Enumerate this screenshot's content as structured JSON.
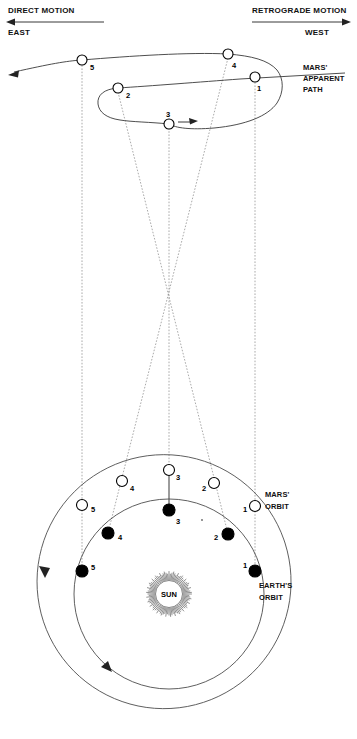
{
  "figure": {
    "header_left": {
      "motion_label": "DIRECT MOTION",
      "direction_label": "EAST",
      "arrow": "left-arrow-icon"
    },
    "header_right": {
      "motion_label": "RETROGRADE MOTION",
      "direction_label": "WEST",
      "arrow": "right-arrow-icon"
    },
    "annotations": {
      "mars_apparent_path": "MARS'\nAPPARENT\nPATH",
      "mars_apparent_path_line1": "MARS'",
      "mars_apparent_path_line2": "APPARENT",
      "mars_apparent_path_line3": "PATH",
      "mars_orbit_line1": "MARS'",
      "mars_orbit_line2": "ORBIT",
      "earth_orbit_line1": "EARTH'S",
      "earth_orbit_line2": "ORBIT",
      "sun_label": "SUN"
    },
    "colors": {
      "background": "#ffffff",
      "ink": "#111111",
      "orbit_stroke": "#4d4d4d",
      "sight_line": "#8d8d8d",
      "marker_fill_earth": "#000000",
      "marker_fill_mars": "#ffffff"
    }
  },
  "chart_data": {
    "type": "diagram-scatter",
    "xlabel": "",
    "ylabel": "",
    "grid": false,
    "legend": false,
    "series": [
      {
        "name": "Mars apparent path (sky)",
        "marker": "open-circle",
        "points": [
          {
            "label": "1",
            "x": 255,
            "y": 77
          },
          {
            "label": "2",
            "x": 118,
            "y": 88
          },
          {
            "label": "3",
            "x": 169,
            "y": 124
          },
          {
            "label": "4",
            "x": 228,
            "y": 54
          },
          {
            "label": "5",
            "x": 82,
            "y": 60
          }
        ]
      },
      {
        "name": "Mars orbital positions",
        "marker": "open-circle",
        "points": [
          {
            "label": "1",
            "x": 255,
            "y": 506
          },
          {
            "label": "2",
            "x": 214,
            "y": 483
          },
          {
            "label": "3",
            "x": 169,
            "y": 470
          },
          {
            "label": "4",
            "x": 122,
            "y": 481
          },
          {
            "label": "5",
            "x": 82,
            "y": 505
          }
        ]
      },
      {
        "name": "Earth orbital positions",
        "marker": "filled-circle",
        "points": [
          {
            "label": "1",
            "x": 255,
            "y": 571
          },
          {
            "label": "2",
            "x": 228,
            "y": 534
          },
          {
            "label": "3",
            "x": 169,
            "y": 510
          },
          {
            "label": "4",
            "x": 108,
            "y": 533
          },
          {
            "label": "5",
            "x": 82,
            "y": 571
          }
        ]
      }
    ],
    "annotations": [
      {
        "text": "SUN",
        "x": 169,
        "y": 597
      },
      {
        "text": "MARS' ORBIT",
        "x": 268,
        "y": 500
      },
      {
        "text": "EARTH'S ORBIT",
        "x": 262,
        "y": 585
      },
      {
        "text": "MARS' APPARENT PATH",
        "x": 300,
        "y": 70
      },
      {
        "text": "DIRECT MOTION / EAST",
        "x": 8,
        "y": 10
      },
      {
        "text": "RETROGRADE MOTION / WEST",
        "x": 252,
        "y": 10
      }
    ],
    "sight_line_convergence": {
      "x": 169,
      "y": 288
    }
  },
  "markers": {
    "sky": {
      "n1": "1",
      "n2": "2",
      "n3": "3",
      "n4": "4",
      "n5": "5"
    },
    "mars": {
      "n1": "1",
      "n2": "2",
      "n3": "3",
      "n4": "4",
      "n5": "5"
    },
    "earth": {
      "n1": "1",
      "n2": "2",
      "n3": "3",
      "n4": "4",
      "n5": "5"
    }
  }
}
